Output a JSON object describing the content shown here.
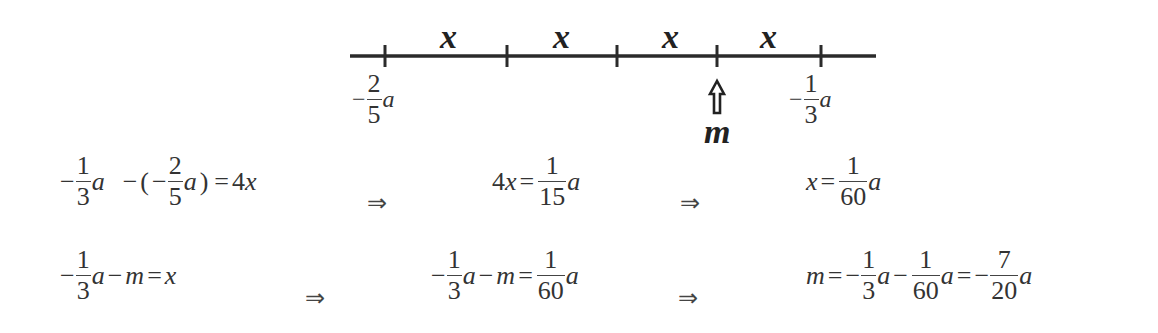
{
  "number_line": {
    "segment_label": "x",
    "segment_labels": [
      "x",
      "x",
      "x",
      "x"
    ],
    "left_endpoint": {
      "sign": "−",
      "numerator": "2",
      "denominator": "5",
      "variable": "a"
    },
    "right_endpoint": {
      "sign": "−",
      "numerator": "1",
      "denominator": "3",
      "variable": "a"
    },
    "marker_label": "m",
    "marker_icon": "hollow-up-arrow",
    "ticks_x": [
      385,
      507,
      617,
      717,
      821
    ],
    "line": {
      "x1": 350,
      "x2": 876,
      "y": 56
    },
    "color": "#2b2b2b"
  },
  "equations": {
    "row1": {
      "step1": {
        "lhs_sign": "−",
        "lhs_num": "1",
        "lhs_den": "3",
        "lhs_var": "a",
        "minus": "−",
        "open": "(",
        "inner_sign": "−",
        "inner_num": "2",
        "inner_den": "5",
        "inner_var": "a",
        "close": ")",
        "eq": "=",
        "rhs": "4",
        "rhs_var": "x"
      },
      "implies1": "⇒",
      "step2": {
        "lhs": "4",
        "lhs_var": "x",
        "eq": "=",
        "num": "1",
        "den": "15",
        "var": "a"
      },
      "implies2": "⇒",
      "step3": {
        "lhs_var": "x",
        "eq": "=",
        "num": "1",
        "den": "60",
        "var": "a"
      }
    },
    "row2": {
      "step1": {
        "sign": "−",
        "num": "1",
        "den": "3",
        "var": "a",
        "minus": "−",
        "m": "m",
        "eq": "=",
        "rhs_var": "x"
      },
      "implies1": "⇒",
      "step2": {
        "sign": "−",
        "num": "1",
        "den": "3",
        "var": "a",
        "minus": "−",
        "m": "m",
        "eq": "=",
        "rhs_num": "1",
        "rhs_den": "60",
        "rhs_var": "a"
      },
      "implies2": "⇒",
      "step3": {
        "m": "m",
        "eq": "=",
        "sign1": "−",
        "num1": "1",
        "den1": "3",
        "var1": "a",
        "minus": "−",
        "num2": "1",
        "den2": "60",
        "var2": "a",
        "eq2": "=",
        "sign3": "−",
        "num3": "7",
        "den3": "20",
        "var3": "a"
      }
    }
  }
}
